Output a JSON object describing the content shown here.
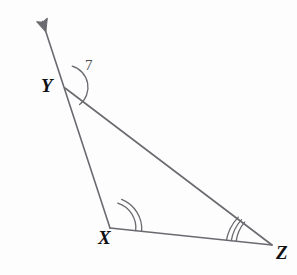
{
  "figure": {
    "kind": "geometry-diagram",
    "shape": "triangle",
    "background_color": "#fdfdfd",
    "stroke_color": "#6a6a70",
    "label_color": "#111114",
    "angle_label_color": "#4a4a50",
    "stroke_width": 1.6
  },
  "vertices": [
    {
      "id": "Y",
      "label": "Y",
      "x": 65,
      "y": 88
    },
    {
      "id": "X",
      "label": "X",
      "x": 110,
      "y": 228
    },
    {
      "id": "Z",
      "label": "Z",
      "x": 272,
      "y": 245
    }
  ],
  "ray": {
    "name": "ray-beyond-Y",
    "from_vertex": "X",
    "through_vertex": "Y",
    "tip_x": 39,
    "tip_y": 18,
    "arrowhead": "solid-triangle"
  },
  "segments": [
    {
      "id": "XY",
      "from": "X",
      "to": "Y"
    },
    {
      "id": "YZ",
      "from": "Y",
      "to": "Z"
    },
    {
      "id": "XZ",
      "from": "X",
      "to": "Z"
    }
  ],
  "angle_marks": [
    {
      "id": "angle-Y-exterior",
      "vertex": "Y",
      "label": "7",
      "arc_count": 1,
      "radius": 22,
      "description": "exterior angle at Y between upward ray and segment YZ"
    },
    {
      "id": "angle-X",
      "vertex": "X",
      "label": "",
      "arc_count": 2,
      "radius": 26,
      "description": "interior angle at X, double arc"
    },
    {
      "id": "angle-Z",
      "vertex": "Z",
      "label": "",
      "arc_count": 3,
      "radius": 36,
      "description": "interior angle at Z, triple arc"
    }
  ],
  "labels": {
    "Y": "Y",
    "X": "X",
    "Z": "Z",
    "angle_7": "7"
  }
}
